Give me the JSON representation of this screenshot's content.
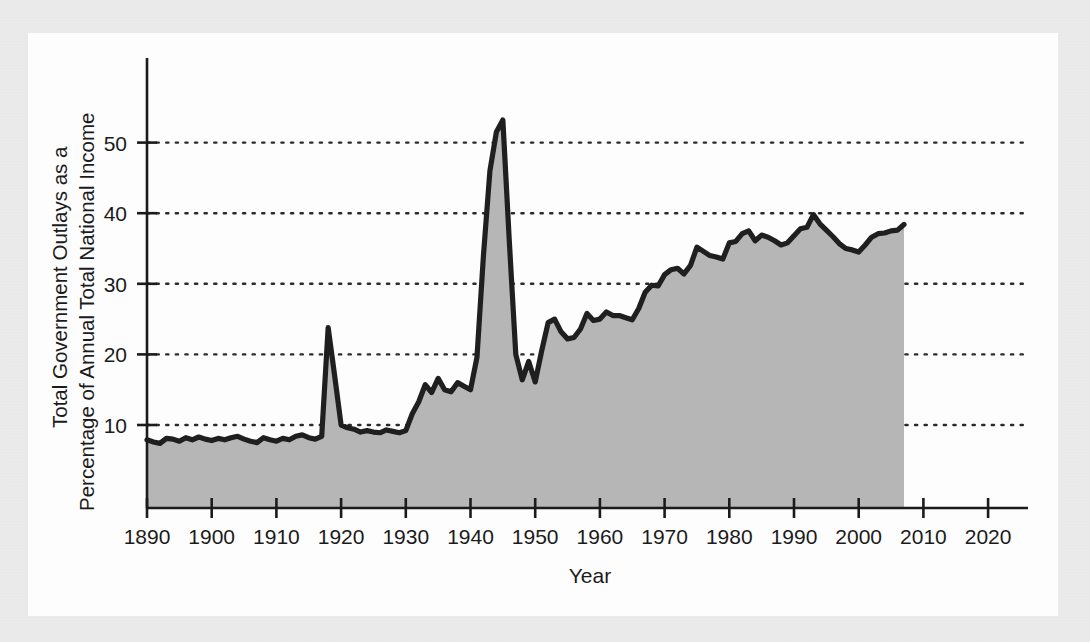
{
  "figure": {
    "background_color": "#ececed",
    "panel_color": "#fdfdfd",
    "series_fill_color": "#b6b6b6",
    "series_line_color": "#1f1f1f",
    "axis_color": "#1b1b1b",
    "gridline_color": "#2a2a2a"
  },
  "chart_data": {
    "type": "area",
    "title": "",
    "subtitle": "",
    "xlabel": "Year",
    "ylabel": "Total Government Outlays as a Percentage of Annual Total National Income",
    "ylabel_lines": [
      "Total Government Outlays as a",
      "Percentage of Annual Total National Income"
    ],
    "xlim": [
      1890,
      2025
    ],
    "ylim": [
      0,
      58
    ],
    "xticks": [
      1890,
      1900,
      1910,
      1920,
      1930,
      1940,
      1950,
      1960,
      1970,
      1980,
      1990,
      2000,
      2010,
      2020
    ],
    "xtick_labels": [
      "1890",
      "1900",
      "1910",
      "1920",
      "1930",
      "1940",
      "1950",
      "1960",
      "1970",
      "1980",
      "1990",
      "2000",
      "2010",
      "2020"
    ],
    "yticks": [
      10,
      20,
      30,
      40,
      50
    ],
    "ytick_labels": [
      "10",
      "20",
      "30",
      "40",
      "50"
    ],
    "grid": "horizontal-dotted",
    "legend": "none",
    "data_start_year": 1890,
    "data_end_year": 2007,
    "series": [
      {
        "name": "Total Government Outlays as a Percentage of Annual Total National Income",
        "x": [
          1890,
          1891,
          1892,
          1893,
          1894,
          1895,
          1896,
          1897,
          1898,
          1899,
          1900,
          1901,
          1902,
          1903,
          1904,
          1905,
          1906,
          1907,
          1908,
          1909,
          1910,
          1911,
          1912,
          1913,
          1914,
          1915,
          1916,
          1917,
          1918,
          1919,
          1920,
          1921,
          1922,
          1923,
          1924,
          1925,
          1926,
          1927,
          1928,
          1929,
          1930,
          1931,
          1932,
          1933,
          1934,
          1935,
          1936,
          1937,
          1938,
          1939,
          1940,
          1941,
          1942,
          1943,
          1944,
          1945,
          1946,
          1947,
          1948,
          1949,
          1950,
          1951,
          1952,
          1953,
          1954,
          1955,
          1956,
          1957,
          1958,
          1959,
          1960,
          1961,
          1962,
          1963,
          1964,
          1965,
          1966,
          1967,
          1968,
          1969,
          1970,
          1971,
          1972,
          1973,
          1974,
          1975,
          1976,
          1977,
          1978,
          1979,
          1980,
          1981,
          1982,
          1983,
          1984,
          1985,
          1986,
          1987,
          1988,
          1989,
          1990,
          1991,
          1992,
          1993,
          1994,
          1995,
          1996,
          1997,
          1998,
          1999,
          2000,
          2001,
          2002,
          2003,
          2004,
          2005,
          2006,
          2007
        ],
        "values": [
          7.9,
          7.6,
          7.4,
          8.1,
          8.0,
          7.7,
          8.2,
          7.9,
          8.3,
          8.0,
          7.8,
          8.1,
          7.9,
          8.2,
          8.4,
          8.0,
          7.7,
          7.5,
          8.2,
          7.9,
          7.7,
          8.1,
          7.9,
          8.4,
          8.6,
          8.2,
          8.0,
          8.4,
          23.8,
          17.0,
          10.0,
          9.6,
          9.4,
          9.0,
          9.2,
          9.0,
          8.9,
          9.3,
          9.1,
          8.9,
          9.2,
          11.6,
          13.3,
          15.7,
          14.6,
          16.6,
          15.0,
          14.7,
          16.0,
          15.5,
          15.0,
          19.6,
          34.0,
          46.0,
          51.5,
          53.2,
          36.0,
          20.0,
          16.4,
          19.0,
          16.1,
          20.5,
          24.5,
          25.0,
          23.2,
          22.2,
          22.4,
          23.6,
          25.8,
          24.8,
          25.0,
          26.0,
          25.5,
          25.5,
          25.2,
          24.9,
          26.5,
          28.8,
          29.8,
          29.7,
          31.3,
          32.0,
          32.2,
          31.4,
          32.6,
          35.2,
          34.6,
          34.0,
          33.8,
          33.5,
          35.8,
          36.0,
          37.1,
          37.5,
          36.1,
          36.9,
          36.6,
          36.1,
          35.5,
          35.8,
          36.8,
          37.8,
          38.0,
          39.8,
          38.5,
          37.6,
          36.7,
          35.7,
          35.0,
          34.8,
          34.5,
          35.5,
          36.6,
          37.1,
          37.2,
          37.5,
          37.6,
          38.4
        ]
      }
    ]
  }
}
